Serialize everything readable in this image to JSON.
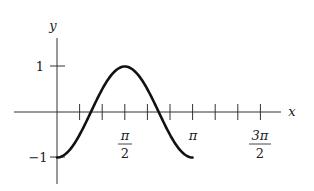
{
  "chart_data": {
    "type": "line",
    "title": "",
    "xlabel": "x",
    "ylabel": "y",
    "function": "y = -cos(2x)",
    "x_tick_labels": [
      "π/2",
      "π",
      "3π/2"
    ],
    "x_tick_values": [
      1.5708,
      3.1416,
      4.7124
    ],
    "x_minor_tick_step": "π/6",
    "y_tick_labels": [
      "1",
      "−1"
    ],
    "y_tick_values": [
      1,
      -1
    ],
    "xlim": [
      0,
      5.2
    ],
    "ylim": [
      -1.5,
      1.5
    ],
    "grid": false,
    "legend": null,
    "series": [
      {
        "name": "curve",
        "x": [
          0,
          0.2618,
          0.5236,
          0.7854,
          1.0472,
          1.309,
          1.5708,
          1.8326,
          2.0944,
          2.3562,
          2.618,
          2.8798,
          3.1416
        ],
        "values": [
          -1,
          -0.866,
          -0.5,
          0,
          0.5,
          0.866,
          1,
          0.866,
          0.5,
          0,
          -0.5,
          -0.866,
          -1
        ]
      }
    ]
  },
  "labels": {
    "x_axis": "x",
    "y_axis": "y",
    "y_one": "1",
    "y_neg_one": "−1",
    "pi_half_num": "π",
    "pi_half_den": "2",
    "pi": "π",
    "three_pi_half_num": "3π",
    "three_pi_half_den": "2"
  }
}
